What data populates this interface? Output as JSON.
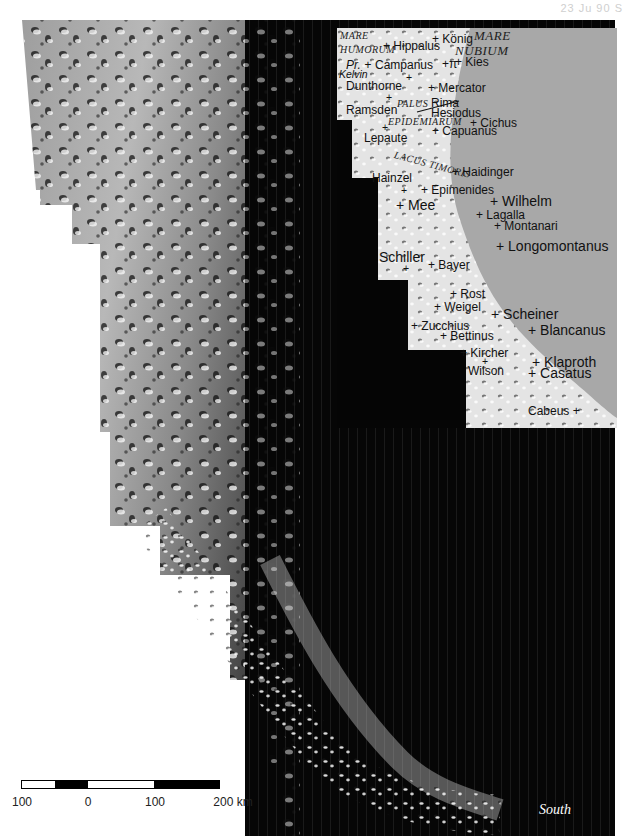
{
  "page_ref": "23 Ju 90 S",
  "map": {
    "type": "lunar-mosaic",
    "orientation_label": "South",
    "regions": [
      {
        "name": "Mare Humorum",
        "lines": [
          "MARE",
          "HUMORUM"
        ]
      },
      {
        "name": "Mare Nubium",
        "lines": [
          "MARE",
          "NUBIUM"
        ]
      },
      {
        "name": "Palus Epidemiarum",
        "lines": [
          "PALUS",
          "EPIDEMIARUM"
        ]
      },
      {
        "name": "Lacus Timoris",
        "lines": [
          "LACUS TIMORIS"
        ]
      }
    ],
    "features": [
      {
        "name": "Hippalus"
      },
      {
        "name": "König"
      },
      {
        "name": "Campanus"
      },
      {
        "name": "Pr."
      },
      {
        "name": "π"
      },
      {
        "name": "Kies"
      },
      {
        "name": "Kelvin"
      },
      {
        "name": "Dunthorne"
      },
      {
        "name": "Mercator"
      },
      {
        "name": "Rima Hesiodus"
      },
      {
        "name": "Ramsden"
      },
      {
        "name": "Cichus"
      },
      {
        "name": "Capuanus"
      },
      {
        "name": "Lepaute"
      },
      {
        "name": "Haidinger"
      },
      {
        "name": "Hainzel"
      },
      {
        "name": "Epimenides"
      },
      {
        "name": "Mee"
      },
      {
        "name": "Wilhelm"
      },
      {
        "name": "Lagalla"
      },
      {
        "name": "Montanari"
      },
      {
        "name": "Longomontanus"
      },
      {
        "name": "Schiller"
      },
      {
        "name": "Bayer"
      },
      {
        "name": "Rost"
      },
      {
        "name": "Weigel"
      },
      {
        "name": "Scheiner"
      },
      {
        "name": "Blancanus"
      },
      {
        "name": "Zucchius"
      },
      {
        "name": "Bettinus"
      },
      {
        "name": "Kircher"
      },
      {
        "name": "Wilson"
      },
      {
        "name": "Klaproth"
      },
      {
        "name": "Casatus"
      },
      {
        "name": "Cabeus"
      }
    ]
  },
  "labels": {
    "mare1": "Mare",
    "humorum": "Humorum",
    "mare2": "Mare",
    "nubium": "Nubium",
    "palus": "Palus",
    "epidemiarum": "Epidemiarum",
    "lacus_timoris": "Lacus Timoris",
    "hippalus": "+ Hippalus",
    "konig": "+ König",
    "pr": "Pr. +",
    "campanus": "Campanus",
    "pi": "+π",
    "kies": "+ Kies",
    "kelvin": "Kelvin",
    "dunthorne": "Dunthorne",
    "mercator": "+ Mercator",
    "rima": "Rima",
    "hesiodus": "Hesiodus",
    "ramsden": "Ramsden",
    "cichus": "+ Cichus",
    "capuanus": "+ Capuanus",
    "lepaute": "Lepaute",
    "haidinger": "+ Haidinger",
    "hainzel": "Hainzel",
    "epimenides": "+ Epimenides",
    "mee": "+ Mee",
    "wilhelm": "+ Wilhelm",
    "lagalla": "+ Lagalla",
    "montanari": "+ Montanari",
    "longomontanus": "+ Longomontanus",
    "schiller": "Schiller",
    "bayer": "+ Bayer",
    "rost": "+ Rost",
    "weigel": "+ Weigel",
    "scheiner": "+ Scheiner",
    "blancanus": "+ Blancanus",
    "zucchius": "+ Zucchius",
    "bettinus": "+ Bettinus",
    "kircher": "+ Kircher",
    "wilson": "Wilson",
    "klaproth": "+ Klaproth",
    "casatus": "+ Casatus",
    "cabeus": "Cabeus +",
    "plus": "+"
  },
  "scale_bar": {
    "unit": "km",
    "ticks": [
      "100",
      "0",
      "100",
      "200 km"
    ],
    "segments": [
      {
        "color": "#ffffff"
      },
      {
        "color": "#000000"
      },
      {
        "color": "#ffffff"
      },
      {
        "color": "#000000"
      }
    ]
  },
  "colors": {
    "space_black": "#050505",
    "inset_gray": "#a9a9a9",
    "highland_light": "#e8e8e8",
    "mosaic_mid": "#9a9a9a"
  }
}
